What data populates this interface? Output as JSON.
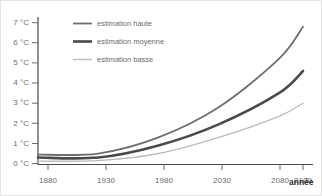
{
  "chart_data": {
    "type": "line",
    "title": "",
    "xlabel": "année",
    "ylabel": "",
    "x": [
      1880,
      1930,
      1980,
      2030,
      2080,
      2100
    ],
    "xtick_labels": [
      "1880",
      "1930",
      "1980",
      "2030",
      "2080",
      "2100"
    ],
    "ytick_labels": [
      "0 °C",
      "1 °C",
      "2 °C",
      "3 °C",
      "4 °C",
      "5 °C",
      "6 °C",
      "7 °C"
    ],
    "ytick_values": [
      0,
      1,
      2,
      3,
      4,
      5,
      6,
      7
    ],
    "xlim": [
      1880,
      2100
    ],
    "ylim": [
      0,
      7.3
    ],
    "grid": false,
    "legend_position": "top-left",
    "series": [
      {
        "name": "estimation haute",
        "color": "#6e6e6e",
        "values": [
          0.45,
          0.5,
          1.3,
          2.8,
          5.2,
          6.8
        ]
      },
      {
        "name": "estimation moyenne",
        "color": "#4a4a4a",
        "values": [
          0.3,
          0.3,
          0.9,
          1.95,
          3.5,
          4.6
        ]
      },
      {
        "name": "estimation basse",
        "color": "#bcbcbc",
        "values": [
          0.12,
          0.15,
          0.5,
          1.3,
          2.35,
          3.0
        ]
      }
    ]
  },
  "axis": {
    "line_color": "#4a4a4a",
    "tick_color": "#6b6b6b"
  },
  "xaxis_title": "année",
  "ytick_labels": {
    "t7": "7 °C",
    "t6": "6 °C",
    "t5": "5 °C",
    "t4": "4 °C",
    "t3": "3 °C",
    "t2": "2 °C",
    "t1": "1 °C",
    "t0": "0 °C"
  },
  "xtick_labels": {
    "x1880": "1880",
    "x1930": "1930",
    "x1980": "1980",
    "x2030": "2030",
    "x2080": "2080",
    "x2100": "2100"
  },
  "legend": {
    "items": [
      {
        "label": "estimation haute",
        "color": "#6e6e6e"
      },
      {
        "label": "estimation moyenne",
        "color": "#4a4a4a"
      },
      {
        "label": "estimation basse",
        "color": "#bcbcbc"
      }
    ]
  }
}
